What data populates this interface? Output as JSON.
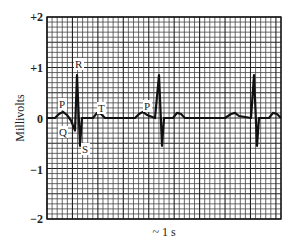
{
  "chart_data": {
    "type": "line",
    "title": "",
    "xlabel": "~ 1 s",
    "ylabel": "Millivolts",
    "ylim": [
      -2,
      2
    ],
    "yticks": [
      {
        "value": 2,
        "label": "+2"
      },
      {
        "value": 1,
        "label": "+1"
      },
      {
        "value": 0,
        "label": "0"
      },
      {
        "value": -1,
        "label": "−1"
      },
      {
        "value": -2,
        "label": "−2"
      }
    ],
    "grid": true,
    "grid_minor_per_mV": 10,
    "grid_major_every": 5,
    "series": [
      {
        "name": "ECG",
        "color": "#111111",
        "points_px_note": "x in plot px (0-234), y in mV",
        "points": [
          [
            0,
            0.0
          ],
          [
            8,
            0.0
          ],
          [
            12,
            0.08
          ],
          [
            16,
            0.12
          ],
          [
            20,
            0.06
          ],
          [
            24,
            -0.05
          ],
          [
            28,
            -0.25
          ],
          [
            30,
            0.85
          ],
          [
            33,
            -0.55
          ],
          [
            35,
            0.0
          ],
          [
            46,
            0.0
          ],
          [
            50,
            0.1
          ],
          [
            54,
            0.08
          ],
          [
            58,
            0.0
          ],
          [
            82,
            0.0
          ],
          [
            88,
            0.0
          ],
          [
            92,
            0.08
          ],
          [
            96,
            0.12
          ],
          [
            100,
            0.06
          ],
          [
            108,
            0.0
          ],
          [
            112,
            0.85
          ],
          [
            115,
            -0.55
          ],
          [
            117,
            0.0
          ],
          [
            126,
            0.0
          ],
          [
            130,
            0.1
          ],
          [
            134,
            0.08
          ],
          [
            138,
            0.0
          ],
          [
            178,
            0.0
          ],
          [
            184,
            0.08
          ],
          [
            188,
            0.1
          ],
          [
            192,
            0.04
          ],
          [
            204,
            0.0
          ],
          [
            207,
            0.85
          ],
          [
            210,
            -0.55
          ],
          [
            212,
            0.0
          ],
          [
            222,
            0.0
          ],
          [
            226,
            0.1
          ],
          [
            230,
            0.08
          ],
          [
            234,
            0.0
          ]
        ]
      }
    ],
    "annotations": [
      {
        "text": "P",
        "near": "first P wave"
      },
      {
        "text": "Q",
        "near": "first Q dip"
      },
      {
        "text": "R",
        "near": "first R peak"
      },
      {
        "text": "S",
        "near": "first S trough"
      },
      {
        "text": "T",
        "near": "first T wave"
      },
      {
        "text": "P",
        "near": "second P wave"
      }
    ]
  },
  "labels": {
    "ylabel": "Millivolts",
    "xlabel": "~ 1 s",
    "tick_p2": "+2",
    "tick_p1": "+1",
    "tick_0": "0",
    "tick_m1": "−1",
    "tick_m2": "−2",
    "P1": "P",
    "Q": "Q",
    "R": "R",
    "S": "S",
    "T": "T",
    "P2": "P"
  }
}
